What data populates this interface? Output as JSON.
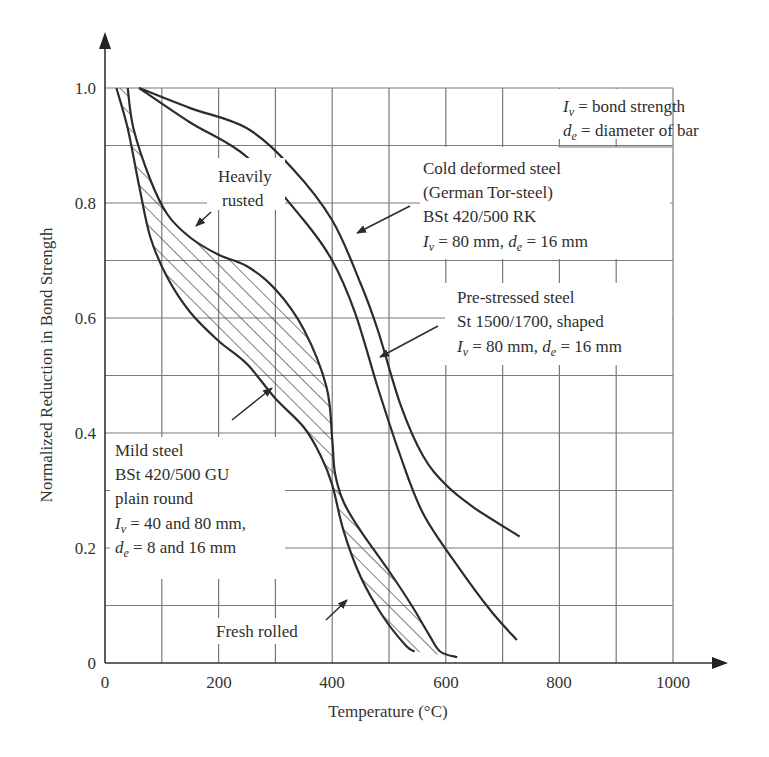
{
  "chart_data": {
    "type": "line",
    "title": "",
    "xlabel": "Temperature (°C)",
    "ylabel": "Normalized Reduction in Bond Strength",
    "xlim": [
      0,
      1000
    ],
    "ylim": [
      0,
      1.0
    ],
    "grid": true,
    "x_ticks": [
      0,
      200,
      400,
      600,
      800,
      1000
    ],
    "x_tick_labels": [
      "0",
      "200",
      "400",
      "600",
      "800",
      "1000"
    ],
    "y_ticks": [
      0,
      0.2,
      0.4,
      0.6,
      0.8,
      1.0
    ],
    "y_tick_labels": [
      "0",
      "0.2",
      "0.4",
      "0.6",
      "0.8",
      "1.0"
    ],
    "series": [
      {
        "name": "Cold deformed steel (German Tor-steel) BSt 420/500 RK",
        "x": [
          60,
          150,
          250,
          330,
          400,
          450,
          480,
          520,
          560,
          600,
          650,
          730
        ],
        "y": [
          1.0,
          0.965,
          0.93,
          0.86,
          0.77,
          0.66,
          0.58,
          0.45,
          0.36,
          0.31,
          0.27,
          0.22
        ]
      },
      {
        "name": "Pre-stressed steel St 1500/1700, shaped",
        "x": [
          60,
          150,
          250,
          350,
          400,
          440,
          480,
          520,
          560,
          620,
          680,
          725
        ],
        "y": [
          1.0,
          0.94,
          0.88,
          0.77,
          0.7,
          0.61,
          0.48,
          0.36,
          0.26,
          0.17,
          0.09,
          0.04
        ]
      },
      {
        "name": "Mild steel - Heavily rusted (upper bound)",
        "x": [
          40,
          50,
          80,
          110,
          150,
          200,
          250,
          300,
          350,
          390,
          400,
          405,
          420,
          450,
          500,
          540,
          570,
          590,
          620
        ],
        "y": [
          1.0,
          0.93,
          0.84,
          0.78,
          0.74,
          0.71,
          0.69,
          0.65,
          0.58,
          0.48,
          0.39,
          0.33,
          0.28,
          0.23,
          0.16,
          0.1,
          0.05,
          0.02,
          0.01
        ]
      },
      {
        "name": "Mild steel - Fresh rolled (lower bound)",
        "x": [
          20,
          40,
          60,
          80,
          110,
          150,
          200,
          250,
          300,
          350,
          380,
          400,
          420,
          450,
          490,
          530,
          545
        ],
        "y": [
          1.0,
          0.93,
          0.83,
          0.74,
          0.67,
          0.61,
          0.56,
          0.52,
          0.46,
          0.41,
          0.36,
          0.31,
          0.23,
          0.15,
          0.08,
          0.03,
          0.02
        ]
      }
    ],
    "shaded_band": {
      "between": [
        "Mild steel - Heavily rusted (upper bound)",
        "Mild steel - Fresh rolled (lower bound)"
      ],
      "pattern": "diagonal hatch"
    },
    "annotations": {
      "legend_box": [
        "I_v = bond strength",
        "d_e = diameter of bar"
      ],
      "heavily_rusted": [
        "Heavily",
        "rusted"
      ],
      "cold_deformed": [
        "Cold deformed steel",
        "(German Tor-steel)",
        "BSt 420/500 RK",
        "I_v = 80 mm, d_e = 16 mm"
      ],
      "pre_stressed": [
        "Pre-stressed steel",
        "St 1500/1700, shaped",
        "I_v = 80 mm, d_e = 16 mm"
      ],
      "mild_steel": [
        "Mild steel",
        "BSt 420/500 GU",
        "plain round",
        "I_v = 40 and 80 mm,",
        "d_e = 8 and 16 mm"
      ],
      "fresh_rolled": [
        "Fresh rolled"
      ]
    }
  },
  "labels": {
    "xlabel": "Temperature (°C)",
    "ylabel": "Normalized Reduction in Bond Strength",
    "x_ticks": [
      "0",
      "200",
      "400",
      "600",
      "800",
      "1000"
    ],
    "y_ticks": [
      "0",
      "0.2",
      "0.4",
      "0.6",
      "0.8",
      "1.0"
    ],
    "legend": {
      "line1_sym": "I",
      "line1_sub": "v",
      "line1_text": " = bond strength",
      "line2_sym": "d",
      "line2_sub": "e",
      "line2_text": " = diameter of bar"
    },
    "heavily": "Heavily",
    "rusted": "rusted",
    "cold": {
      "l1": "Cold deformed steel",
      "l2": "(German Tor-steel)",
      "l3": "BSt 420/500 RK",
      "l4a": " = 80 mm, ",
      "l4b": " = 16 mm"
    },
    "pre": {
      "l1": "Pre-stressed steel",
      "l2": "St 1500/1700, shaped",
      "l3a": " = 80 mm, ",
      "l3b": " = 16 mm"
    },
    "mild": {
      "l1": "Mild steel",
      "l2": "BSt 420/500 GU",
      "l3": "plain round",
      "l4": " = 40 and 80 mm,",
      "l5": " = 8 and 16 mm"
    },
    "fresh": "Fresh rolled",
    "sym_I": "I",
    "sym_d": "d",
    "sub_v": "v",
    "sub_e": "e"
  }
}
